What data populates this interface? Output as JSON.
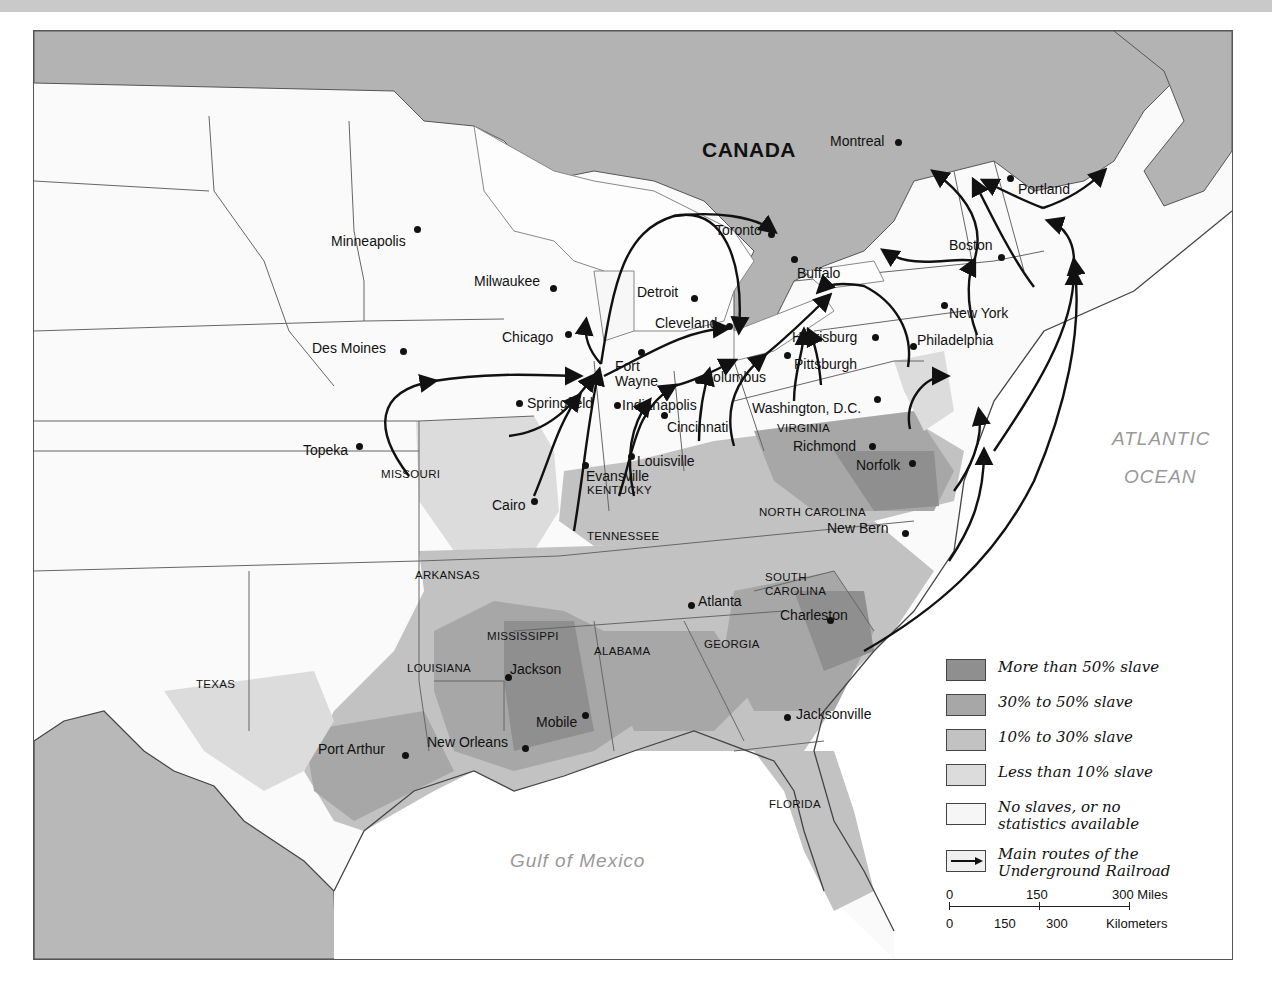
{
  "map": {
    "country_label": "CANADA",
    "water_labels": {
      "atlantic_line1": "ATLANTIC",
      "atlantic_line2": "OCEAN",
      "gulf": "Gulf of Mexico"
    },
    "states": [
      {
        "name": "MISSOURI",
        "x": 380,
        "y": 468
      },
      {
        "name": "KENTUCKY",
        "x": 586,
        "y": 484
      },
      {
        "name": "VIRGINIA",
        "x": 776,
        "y": 422
      },
      {
        "name": "NORTH CAROLINA",
        "x": 758,
        "y": 506
      },
      {
        "name": "TENNESSEE",
        "x": 586,
        "y": 530
      },
      {
        "name": "ARKANSAS",
        "x": 414,
        "y": 569
      },
      {
        "name": "SOUTH",
        "x": 764,
        "y": 571
      },
      {
        "name": "CAROLINA",
        "x": 764,
        "y": 585
      },
      {
        "name": "MISSISSIPPI",
        "x": 486,
        "y": 630
      },
      {
        "name": "ALABAMA",
        "x": 593,
        "y": 645
      },
      {
        "name": "GEORGIA",
        "x": 703,
        "y": 638
      },
      {
        "name": "LOUISIANA",
        "x": 406,
        "y": 662
      },
      {
        "name": "TEXAS",
        "x": 195,
        "y": 678
      },
      {
        "name": "FLORIDA",
        "x": 768,
        "y": 798
      }
    ],
    "cities": [
      {
        "name": "Montreal",
        "lx": 829,
        "ly": 133,
        "dx": 897,
        "dy": 141
      },
      {
        "name": "Portland",
        "lx": 1017,
        "ly": 181,
        "dx": 1009,
        "dy": 177
      },
      {
        "name": "Minneapolis",
        "lx": 330,
        "ly": 233,
        "dx": 416,
        "dy": 228
      },
      {
        "name": "Toronto",
        "lx": 714,
        "ly": 222,
        "dx": 770,
        "dy": 233
      },
      {
        "name": "Boston",
        "lx": 948,
        "ly": 237,
        "dx": 1000,
        "dy": 256
      },
      {
        "name": "Milwaukee",
        "lx": 473,
        "ly": 273,
        "dx": 552,
        "dy": 287
      },
      {
        "name": "Buffalo",
        "lx": 796,
        "ly": 265,
        "dx": 793,
        "dy": 258
      },
      {
        "name": "Detroit",
        "lx": 636,
        "ly": 284,
        "dx": 693,
        "dy": 297
      },
      {
        "name": "New York",
        "lx": 948,
        "ly": 305,
        "dx": 943,
        "dy": 304
      },
      {
        "name": "Chicago",
        "lx": 501,
        "ly": 329,
        "dx": 567,
        "dy": 333
      },
      {
        "name": "Cleveland",
        "lx": 654,
        "ly": 315,
        "dx": 728,
        "dy": 325
      },
      {
        "name": "Des Moines",
        "lx": 311,
        "ly": 340,
        "dx": 402,
        "dy": 350
      },
      {
        "name": "Harrisburg",
        "lx": 791,
        "ly": 329,
        "dx": 874,
        "dy": 336
      },
      {
        "name": "Philadelphia",
        "lx": 916,
        "ly": 332,
        "dx": 912,
        "dy": 345
      },
      {
        "name": "Fort",
        "lx": 614,
        "ly": 358,
        "dx": 640,
        "dy": 351
      },
      {
        "name": "Wayne",
        "lx": 614,
        "ly": 373,
        "dx": null,
        "dy": null
      },
      {
        "name": "Pittsburgh",
        "lx": 793,
        "ly": 356,
        "dx": 786,
        "dy": 354
      },
      {
        "name": "Columbus",
        "lx": 702,
        "ly": 369,
        "dx": 697,
        "dy": 379
      },
      {
        "name": "Springfield",
        "lx": 526,
        "ly": 395,
        "dx": 518,
        "dy": 402
      },
      {
        "name": "Indianapolis",
        "lx": 621,
        "ly": 397,
        "dx": 616,
        "dy": 404
      },
      {
        "name": "Washington, D.C.",
        "lx": 751,
        "ly": 400,
        "dx": 876,
        "dy": 398
      },
      {
        "name": "Cincinnati",
        "lx": 666,
        "ly": 419,
        "dx": 663,
        "dy": 414
      },
      {
        "name": "Topeka",
        "lx": 302,
        "ly": 442,
        "dx": 358,
        "dy": 445
      },
      {
        "name": "Richmond",
        "lx": 792,
        "ly": 438,
        "dx": 871,
        "dy": 445
      },
      {
        "name": "Louisville",
        "lx": 636,
        "ly": 453,
        "dx": 630,
        "dy": 455
      },
      {
        "name": "Evansville",
        "lx": 585,
        "ly": 468,
        "dx": 584,
        "dy": 464
      },
      {
        "name": "Norfolk",
        "lx": 855,
        "ly": 457,
        "dx": 911,
        "dy": 462
      },
      {
        "name": "Cairo",
        "lx": 491,
        "ly": 497,
        "dx": 533,
        "dy": 500
      },
      {
        "name": "New Bern",
        "lx": 826,
        "ly": 520,
        "dx": 904,
        "dy": 532
      },
      {
        "name": "Atlanta",
        "lx": 697,
        "ly": 593,
        "dx": 690,
        "dy": 604
      },
      {
        "name": "Charleston",
        "lx": 779,
        "ly": 607,
        "dx": 829,
        "dy": 619
      },
      {
        "name": "Jackson",
        "lx": 509,
        "ly": 661,
        "dx": 507,
        "dy": 676
      },
      {
        "name": "Mobile",
        "lx": 535,
        "ly": 714,
        "dx": 584,
        "dy": 714
      },
      {
        "name": "Jacksonville",
        "lx": 795,
        "ly": 706,
        "dx": 786,
        "dy": 716
      },
      {
        "name": "New Orleans",
        "lx": 426,
        "ly": 734,
        "dx": 524,
        "dy": 747
      },
      {
        "name": "Port Arthur",
        "lx": 317,
        "ly": 741,
        "dx": 404,
        "dy": 754
      }
    ]
  },
  "legend": {
    "items": [
      {
        "label": "More than 50% slave",
        "color": "#8f8f8f"
      },
      {
        "label": "30% to 50% slave",
        "color": "#a7a7a7"
      },
      {
        "label": "10% to 30% slave",
        "color": "#c2c2c2"
      },
      {
        "label": "Less than 10% slave",
        "color": "#dcdcdc"
      },
      {
        "label_line1": "No slaves, or no",
        "label_line2": "statistics available",
        "color": "#f6f6f6"
      },
      {
        "label_line1": "Main routes of the",
        "label_line2": "Underground Railroad",
        "color": "#f0f0f0"
      }
    ],
    "scale": {
      "miles_ticks": [
        "0",
        "150",
        "300 Miles"
      ],
      "km_ticks": [
        "0",
        "150",
        "300",
        "Kilometers"
      ]
    }
  },
  "colors": {
    "canada": "#b3b3b3",
    "mexico": "#b8b8b8",
    "free_land": "#f7f7f7",
    "water": "#ffffff",
    "lakes": "#fdfdfd",
    "route": "#111111"
  }
}
